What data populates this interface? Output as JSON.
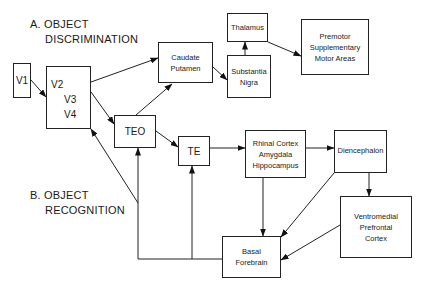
{
  "sections": {
    "a": {
      "line1": "A.  OBJECT",
      "line2": "DISCRIMINATION"
    },
    "b": {
      "line1": "B.  OBJECT",
      "line2": "RECOGNITION"
    }
  },
  "nodes": {
    "v1": {
      "lines": [
        "V1"
      ]
    },
    "v234": {
      "lines": [
        "V2",
        "V3",
        "V4"
      ]
    },
    "caudate": {
      "lines": [
        "Caudate",
        "Putamen"
      ]
    },
    "thalamus": {
      "lines": [
        "Thalamus"
      ]
    },
    "nigra": {
      "lines": [
        "Substantia",
        "Nigra"
      ]
    },
    "premotor": {
      "lines": [
        "Premotor",
        "Supplementary",
        "Motor Areas"
      ]
    },
    "teo": {
      "lines": [
        "TEO"
      ]
    },
    "te": {
      "lines": [
        "TE"
      ]
    },
    "rhinal": {
      "lines": [
        "Rhinal Cortex",
        "Amygdala",
        "Hippocampus"
      ]
    },
    "diencephalon": {
      "lines": [
        "Diencephalon"
      ]
    },
    "vmpfc": {
      "lines": [
        "Ventromedial",
        "Prefrontal",
        "Cortex"
      ]
    },
    "basal": {
      "lines": [
        "Basal",
        "Forebrain"
      ]
    }
  },
  "edges": [
    [
      "V1",
      "V2/V3/V4"
    ],
    [
      "V2/V3/V4",
      "Caudate Putamen"
    ],
    [
      "V2/V3/V4",
      "TEO"
    ],
    [
      "TEO",
      "Caudate Putamen"
    ],
    [
      "TEO",
      "TE"
    ],
    [
      "Caudate Putamen",
      "Substantia Nigra"
    ],
    [
      "Substantia Nigra",
      "Thalamus"
    ],
    [
      "Thalamus",
      "Premotor Supplementary Motor Areas"
    ],
    [
      "TE",
      "Rhinal Cortex Amygdala Hippocampus"
    ],
    [
      "Rhinal Cortex Amygdala Hippocampus",
      "Diencephalon"
    ],
    [
      "Rhinal Cortex Amygdala Hippocampus",
      "Basal Forebrain"
    ],
    [
      "Diencephalon",
      "Ventromedial Prefrontal Cortex"
    ],
    [
      "Diencephalon",
      "Basal Forebrain"
    ],
    [
      "Ventromedial Prefrontal Cortex",
      "Basal Forebrain"
    ],
    [
      "Basal Forebrain",
      "TEO"
    ],
    [
      "Basal Forebrain",
      "TE"
    ],
    [
      "Basal Forebrain",
      "V2/V3/V4"
    ]
  ]
}
